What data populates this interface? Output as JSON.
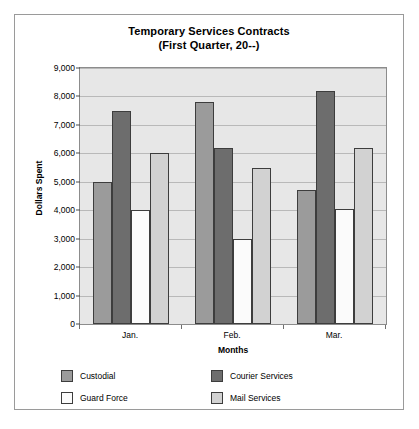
{
  "chart_data": {
    "type": "bar",
    "title": "Temporary Services Contracts",
    "subtitle": "(First Quarter, 20--)",
    "xlabel": "Months",
    "ylabel": "Dollars Spent",
    "categories": [
      "Jan.",
      "Feb.",
      "Mar."
    ],
    "ylim": [
      0,
      9000
    ],
    "ytick_labels": [
      "0",
      "1,000",
      "2,000",
      "3,000",
      "4,000",
      "5,000",
      "6,000",
      "7,000",
      "8,000",
      "9,000"
    ],
    "ytick_values": [
      0,
      1000,
      2000,
      3000,
      4000,
      5000,
      6000,
      7000,
      8000,
      9000
    ],
    "grid": true,
    "legend_position": "bottom",
    "series": [
      {
        "name": "Custodial",
        "color": "#9b9b9b",
        "values": [
          5000,
          7800,
          4700
        ]
      },
      {
        "name": "Courier Services",
        "color": "#6d6d6d",
        "values": [
          7500,
          6200,
          8200
        ]
      },
      {
        "name": "Guard Force",
        "color": "#fbfbfb",
        "values": [
          4000,
          3000,
          4050
        ]
      },
      {
        "name": "Mail Services",
        "color": "#d2d2d2",
        "values": [
          6000,
          5500,
          6200
        ]
      }
    ]
  }
}
